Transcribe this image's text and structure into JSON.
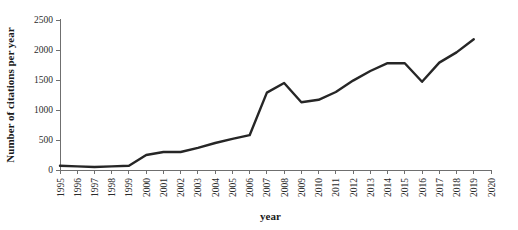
{
  "chart_data": {
    "type": "line",
    "title": "",
    "xlabel": "year",
    "ylabel": "Number of citations per year",
    "xlim": [
      1995,
      2020
    ],
    "ylim": [
      0,
      2500
    ],
    "grid": false,
    "legend": null,
    "line_color": "#262626",
    "axis_color": "#6f6f6f",
    "y_ticks": [
      0,
      500,
      1000,
      1500,
      2000,
      2500
    ],
    "y_tick_labels": [
      "0",
      "500",
      "1000",
      "1500",
      "2000",
      "2500"
    ],
    "x_ticks": [
      1995,
      1996,
      1997,
      1998,
      1999,
      2000,
      2001,
      2002,
      2003,
      2004,
      2005,
      2006,
      2007,
      2008,
      2009,
      2010,
      2011,
      2012,
      2013,
      2014,
      2015,
      2016,
      2017,
      2018,
      2019,
      2020
    ],
    "x_tick_labels": [
      "1995",
      "1996",
      "1997",
      "1998",
      "1999",
      "2000",
      "2001",
      "2002",
      "2003",
      "2004",
      "2005",
      "2006",
      "2007",
      "2008",
      "2009",
      "2010",
      "2011",
      "2012",
      "2013",
      "2014",
      "2015",
      "2016",
      "2017",
      "2018",
      "2019",
      "2020"
    ],
    "x": [
      1995,
      1996,
      1997,
      1998,
      1999,
      2000,
      2001,
      2002,
      2003,
      2004,
      2005,
      2006,
      2007,
      2008,
      2009,
      2010,
      2011,
      2012,
      2013,
      2014,
      2015,
      2016,
      2017,
      2018,
      2019
    ],
    "values": [
      70,
      60,
      50,
      60,
      70,
      250,
      300,
      300,
      370,
      450,
      520,
      580,
      1290,
      1450,
      1130,
      1170,
      1300,
      1490,
      1650,
      1780,
      1780,
      1470,
      1790,
      1960,
      2180
    ]
  }
}
